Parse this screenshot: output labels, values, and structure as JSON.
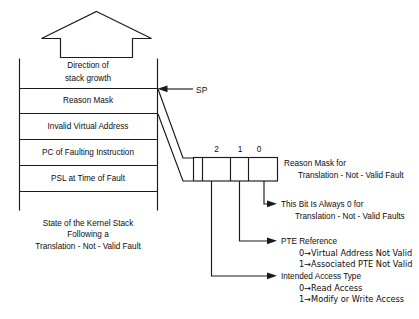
{
  "figure": {
    "domain_kind": "technical-block-diagram",
    "background_color": "#ffffff",
    "line_color": "#1a1a1a",
    "text_color": "#0d0d0d"
  },
  "growth_arrow": {
    "icon": "up-arrow-icon",
    "label_line1": "Direction of",
    "label_line2": "stack growth"
  },
  "stack": {
    "pointer_label": "SP",
    "pointer_icon": "left-arrow-icon",
    "cells": [
      {
        "label": "Reason Mask"
      },
      {
        "label": "Invalid Virtual Address"
      },
      {
        "label": "PC of Faulting Instruction"
      },
      {
        "label": "PSL at Time of Fault"
      }
    ],
    "caption_line1": "State of the Kernel Stack",
    "caption_line2": "Following a",
    "caption_line3": "Translation - Not - Valid Fault"
  },
  "bitfield": {
    "bit_labels": [
      "2",
      "1",
      "0"
    ],
    "title_line1": "Reason Mask for",
    "title_line2": "Translation - Not - Valid Fault"
  },
  "annotations": [
    {
      "bit": "0",
      "heading_line1": "This Bit Is Always 0 for",
      "heading_line2": "Translation - Not - Valid Faults",
      "values": []
    },
    {
      "bit": "1",
      "heading_line1": "PTE Reference",
      "heading_line2": "",
      "values": [
        "0→Virtual Address Not Valid",
        "1→Associated PTE Not Valid"
      ]
    },
    {
      "bit": "2",
      "heading_line1": "Intended Access Type",
      "heading_line2": "",
      "values": [
        "0→Read Access",
        "1→Modify or Write Access"
      ]
    }
  ]
}
